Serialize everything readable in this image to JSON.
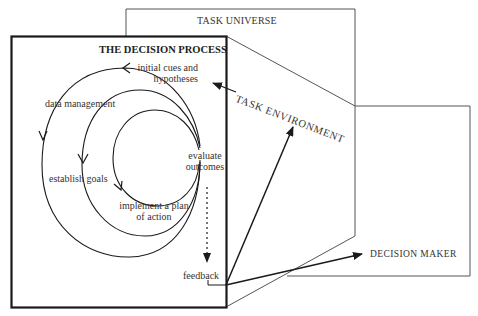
{
  "diagram": {
    "task_universe": {
      "label": "TASK UNIVERSE"
    },
    "decision_process": {
      "title": "THE DECISION PROCESS",
      "steps": {
        "initial_cues": [
          "initial cues and",
          "hypotheses"
        ],
        "data_management": "data management",
        "establish_goals": "establish goals",
        "implement_plan": [
          "implement a plan",
          "of action"
        ],
        "evaluate_outcomes": [
          "evaluate",
          "outcomes"
        ],
        "feedback": "feedback"
      }
    },
    "task_environment": {
      "label": "TASK ENVIRONMENT"
    },
    "decision_maker": {
      "label": "DECISION MAKER"
    },
    "colors": {
      "line": "#1a1a1a",
      "thin_line": "#555555",
      "background": "#ffffff"
    }
  }
}
